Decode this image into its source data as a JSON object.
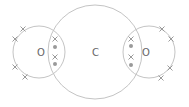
{
  "diagram": {
    "type": "dot-and-cross",
    "colors": {
      "shell": "#c4c4c4",
      "electron": "#9a9a9a",
      "label": "#666666",
      "background": "#ffffff"
    },
    "atoms": [
      {
        "id": "oxygen-left",
        "label": "O",
        "cx": 39,
        "cy": 52,
        "r": 26,
        "lx": 37,
        "ly": 56
      },
      {
        "id": "carbon",
        "label": "C",
        "cx": 95,
        "cy": 52,
        "r": 47,
        "lx": 92,
        "ly": 56
      },
      {
        "id": "oxygen-right",
        "label": "O",
        "cx": 149,
        "cy": 52,
        "r": 26,
        "lx": 142,
        "ly": 56
      }
    ],
    "electrons": {
      "crosses": [
        [
          23,
          29
        ],
        [
          15,
          39
        ],
        [
          15,
          67
        ],
        [
          25,
          77
        ],
        [
          162,
          29
        ],
        [
          171,
          39
        ],
        [
          170,
          68
        ],
        [
          161,
          78
        ],
        [
          55,
          39
        ],
        [
          55,
          57
        ],
        [
          131,
          39
        ],
        [
          131,
          57
        ]
      ],
      "dots": [
        [
          55,
          47
        ],
        [
          55,
          64
        ],
        [
          131,
          46
        ],
        [
          131,
          65
        ]
      ]
    }
  }
}
